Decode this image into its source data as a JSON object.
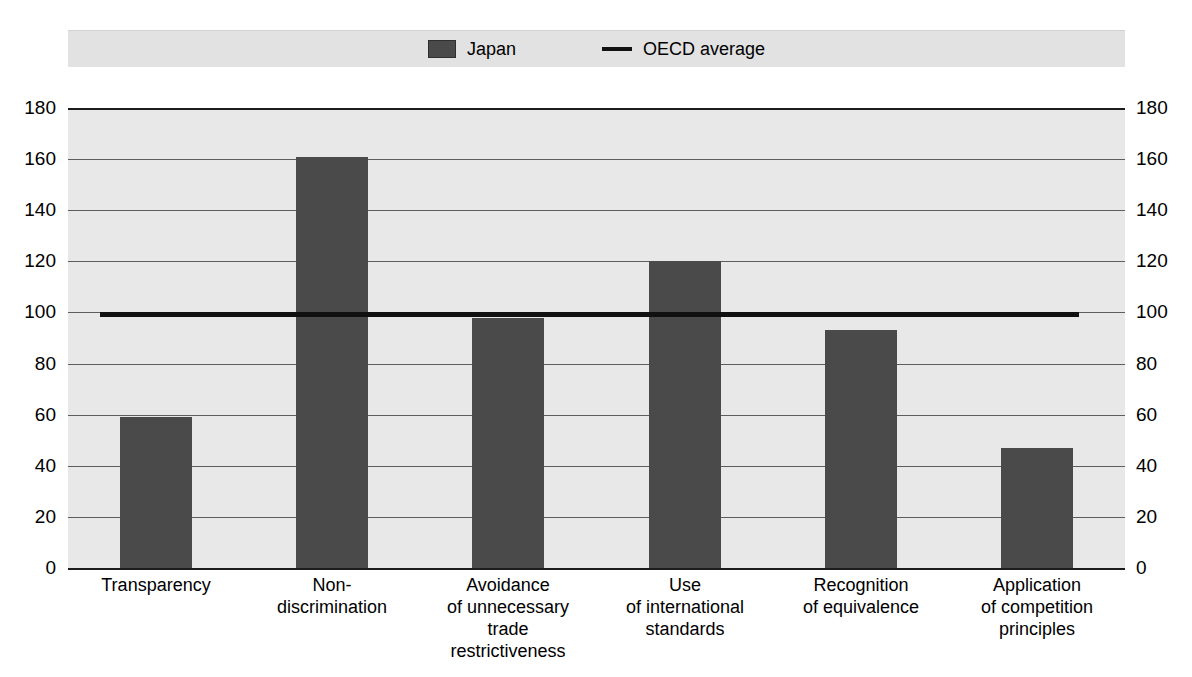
{
  "chart_data": {
    "type": "bar",
    "title": "",
    "xlabel": "",
    "ylabel": "",
    "ylim": [
      0,
      180
    ],
    "ytick_step": 20,
    "grid": true,
    "legend_position": "top-center",
    "categories": [
      "Transparency",
      "Non-discrimination",
      "Avoidance of unnecessary trade restrictiveness",
      "Use of international standards",
      "Recognition of equivalence",
      "Application of competition principles"
    ],
    "category_lines": [
      [
        "Transparency"
      ],
      [
        "Non-",
        "discrimination"
      ],
      [
        "Avoidance",
        "of unnecessary",
        "trade",
        "restrictiveness"
      ],
      [
        "Use",
        "of international",
        "standards"
      ],
      [
        "Recognition",
        "of equivalence"
      ],
      [
        "Application",
        "of competition",
        "principles"
      ]
    ],
    "series": [
      {
        "name": "Japan",
        "type": "bar",
        "color": "#4a4a4a",
        "values": [
          59,
          161,
          98,
          120,
          93,
          47
        ]
      },
      {
        "name": "OECD average",
        "type": "line",
        "color": "#111111",
        "value": 100
      }
    ],
    "yticks": [
      180,
      160,
      140,
      120,
      100,
      80,
      60,
      40,
      20,
      0
    ],
    "ytick_labels_left": [
      "180",
      "160",
      "140",
      "120",
      "100",
      "80",
      "60",
      "40",
      "20",
      "0"
    ],
    "ytick_labels_right": [
      "180",
      "160",
      "140",
      "120",
      "100",
      "80",
      "60",
      "40",
      "20",
      "0"
    ]
  },
  "legend": {
    "japan_label": "Japan",
    "oecd_label": "OECD average"
  },
  "axis": {
    "left": {
      "t180": "180",
      "t160": "160",
      "t140": "140",
      "t120": "120",
      "t100": "100",
      "t80": "80",
      "t60": "60",
      "t40": "40",
      "t20": "20",
      "t0": "0"
    },
    "right": {
      "t180": "180",
      "t160": "160",
      "t140": "140",
      "t120": "120",
      "t100": "100",
      "t80": "80",
      "t60": "60",
      "t40": "40",
      "t20": "20",
      "t0": "0"
    }
  },
  "categories": {
    "c0_l0": "Transparency",
    "c1_l0": "Non-",
    "c1_l1": "discrimination",
    "c2_l0": "Avoidance",
    "c2_l1": "of unnecessary",
    "c2_l2": "trade",
    "c2_l3": "restrictiveness",
    "c3_l0": "Use",
    "c3_l1": "of international",
    "c3_l2": "standards",
    "c4_l0": "Recognition",
    "c4_l1": "of equivalence",
    "c5_l0": "Application",
    "c5_l1": "of competition",
    "c5_l2": "principles"
  },
  "colors": {
    "bar": "#4a4a4a",
    "avg_line": "#111111",
    "plot_background": "#e8e8e8",
    "legend_background": "#e2e2e2",
    "grid": "#5d5d5d",
    "page_background": "#ffffff"
  }
}
